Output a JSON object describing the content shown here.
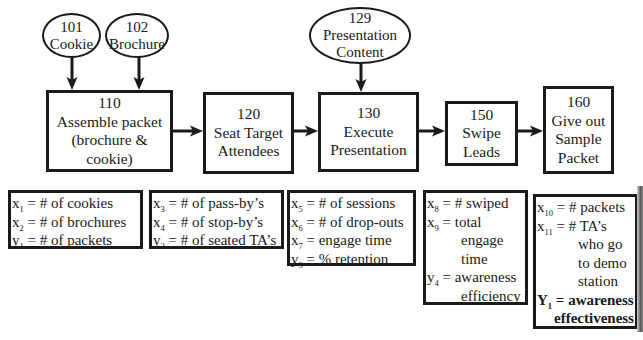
{
  "diagram": {
    "inputs": [
      {
        "id": "101",
        "label": "Cookie"
      },
      {
        "id": "102",
        "label": "Brochure"
      },
      {
        "id": "129",
        "label_lines": [
          "Presentation",
          "Content"
        ]
      }
    ],
    "steps": [
      {
        "id": "110",
        "lines": [
          "Assemble packet",
          "(brochure &",
          "cookie)"
        ]
      },
      {
        "id": "120",
        "lines": [
          "Seat Target",
          "Attendees"
        ]
      },
      {
        "id": "130",
        "lines": [
          "Execute",
          "Presentation"
        ]
      },
      {
        "id": "150",
        "lines": [
          "Swipe",
          "Leads"
        ]
      },
      {
        "id": "160",
        "lines": [
          "Give out",
          "Sample",
          "Packet"
        ]
      }
    ],
    "metrics": [
      {
        "step": "110",
        "lines": [
          {
            "var": "x",
            "sub": "1",
            "text": " = # of cookies"
          },
          {
            "var": "x",
            "sub": "2",
            "text": " = # of brochures"
          },
          {
            "var": "y",
            "sub": "1",
            "text": " = # of packets"
          }
        ]
      },
      {
        "step": "120",
        "lines": [
          {
            "var": "x",
            "sub": "3",
            "text": " = # of pass-by’s"
          },
          {
            "var": "x",
            "sub": "4",
            "text": " = # of stop-by’s"
          },
          {
            "var": "y",
            "sub": "2",
            "text": " = # of seated TA’s"
          }
        ]
      },
      {
        "step": "130",
        "lines": [
          {
            "var": "x",
            "sub": "5",
            "text": " = # of sessions"
          },
          {
            "var": "x",
            "sub": "6",
            "text": " = # of drop-outs"
          },
          {
            "var": "x",
            "sub": "7",
            "text": " = engage time"
          },
          {
            "var": "y",
            "sub": "3",
            "text": " = % retention"
          }
        ]
      },
      {
        "step": "150",
        "lines": [
          {
            "var": "x",
            "sub": "8",
            "text": " = # swiped"
          },
          {
            "var": "x",
            "sub": "9",
            "text": " = total"
          },
          {
            "text": "engage"
          },
          {
            "text": "time"
          },
          {
            "var": "y",
            "sub": "4",
            "text": " = awareness"
          },
          {
            "text": "efficiency"
          }
        ]
      },
      {
        "step": "160",
        "lines": [
          {
            "var": "x",
            "sub": "10",
            "text": " = # packets"
          },
          {
            "var": "x",
            "sub": "11",
            "text": " = # TA’s"
          },
          {
            "text": "who go"
          },
          {
            "text": "to demo"
          },
          {
            "text": "station"
          },
          {
            "var": "Y",
            "sub": "1",
            "text": " = awareness"
          },
          {
            "text": "effectiveness"
          }
        ]
      }
    ],
    "edges": [
      {
        "from": "101",
        "to": "110"
      },
      {
        "from": "102",
        "to": "110"
      },
      {
        "from": "110",
        "to": "120"
      },
      {
        "from": "120",
        "to": "130"
      },
      {
        "from": "129",
        "to": "130"
      },
      {
        "from": "130",
        "to": "150"
      },
      {
        "from": "150",
        "to": "160"
      }
    ]
  }
}
